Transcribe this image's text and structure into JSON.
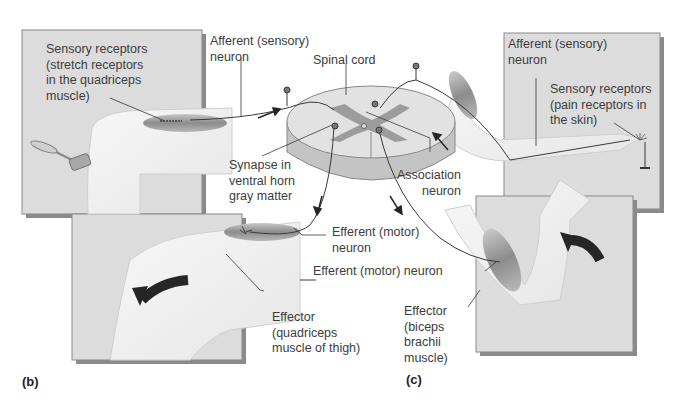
{
  "figure": {
    "panel_b": {
      "letter": "(b)",
      "sensory_receptors": "Sensory receptors\n(stretch receptors\nin the quadriceps\nmuscle)",
      "afferent_neuron": "Afferent (sensory)\nneuron",
      "synapse": "Synapse in\nventral horn\ngray matter",
      "efferent_neuron": "Efferent (motor)\nneuron",
      "effector": "Effector\n(quadriceps\nmuscle of thigh)"
    },
    "center": {
      "spinal_cord": "Spinal cord",
      "association_neuron": "Association\nneuron"
    },
    "panel_c": {
      "letter": "(c)",
      "afferent_neuron": "Afferent (sensory)\nneuron",
      "sensory_receptors": "Sensory receptors\n(pain receptors in\nthe skin)",
      "efferent_neuron": "Efferent (motor) neuron",
      "effector": "Effector\n(biceps\nbrachii\nmuscle)"
    },
    "colors": {
      "panel_bg": "#dcdcdc",
      "panel_shadow": "#8a8a8a",
      "muscle": "#9a9a9a",
      "gray_matter": "#9c9c9c",
      "white_matter": "#e2e2e2",
      "arrow": "#262626"
    }
  }
}
